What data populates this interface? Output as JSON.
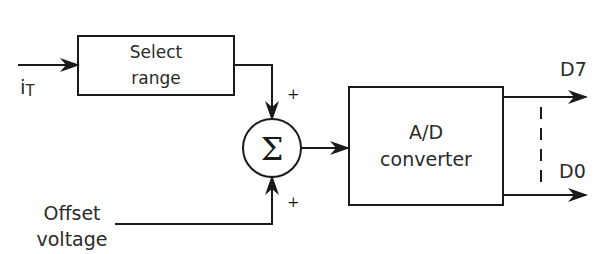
{
  "diagram": {
    "input_label": "i",
    "input_subscript": "T",
    "select_range": {
      "line1": "Select",
      "line2": "range"
    },
    "summer": {
      "symbol": "Σ",
      "top_sign": "+",
      "bottom_sign": "+"
    },
    "offset": {
      "line1": "Offset",
      "line2": "voltage"
    },
    "adc": {
      "line1": "A/D",
      "line2": "converter"
    },
    "outputs": {
      "msb": "D7",
      "lsb": "D0"
    },
    "colors": {
      "stroke": "#1a1a1a",
      "text": "#2a2a2a",
      "background": "#ffffff"
    }
  }
}
